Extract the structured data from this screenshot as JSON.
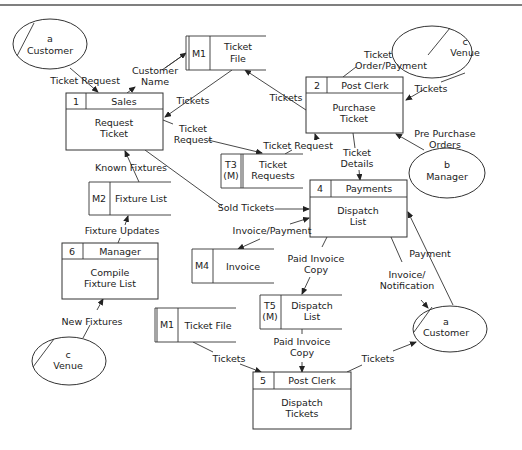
{
  "diagram": {
    "type": "data-flow-diagram",
    "external_entities": [
      {
        "id": "a",
        "name": "Customer",
        "position": "top-left"
      },
      {
        "id": "c",
        "name": "Venue",
        "position": "top-right"
      },
      {
        "id": "b",
        "name": "Manager",
        "position": "right"
      },
      {
        "id": "a",
        "name": "Customer",
        "position": "bottom-right"
      },
      {
        "id": "c",
        "name": "Venue",
        "position": "bottom-left"
      }
    ],
    "processes": [
      {
        "number": "1",
        "actor": "Sales",
        "name_line1": "Request",
        "name_line2": "Ticket"
      },
      {
        "number": "2",
        "actor": "Post Clerk",
        "name_line1": "Purchase",
        "name_line2": "Ticket"
      },
      {
        "number": "4",
        "actor": "Payments",
        "name_line1": "Dispatch",
        "name_line2": "List"
      },
      {
        "number": "6",
        "actor": "Manager",
        "name_line1": "Compile",
        "name_line2": "Fixture List"
      },
      {
        "number": "5",
        "actor": "Post Clerk",
        "name_line1": "Dispatch",
        "name_line2": "Tickets"
      }
    ],
    "data_stores": [
      {
        "id": "M1",
        "name_line1": "Ticket",
        "name_line2": "File"
      },
      {
        "id_line1": "T3",
        "id_line2": "(M)",
        "name_line1": "Ticket",
        "name_line2": "Requests"
      },
      {
        "id": "M2",
        "name": "Fixture List"
      },
      {
        "id": "M4",
        "name": "Invoice"
      },
      {
        "id_line1": "T5",
        "id_line2": "(M)",
        "name_line1": "Dispatch",
        "name_line2": "List"
      },
      {
        "id": "M1",
        "name": "Ticket File"
      }
    ],
    "flows": {
      "ticket_request_1": "Ticket Request",
      "customer_name_l1": "Customer",
      "customer_name_l2": "Name",
      "tickets_m1_to_p1": "Tickets",
      "tickets_p2_to_m1": "Tickets",
      "ticket_order_l1": "Ticket",
      "ticket_order_l2": "Order/Payment",
      "tickets_venue_to_p2": "Tickets",
      "pre_purchase_l1": "Pre Purchase",
      "pre_purchase_l2": "Orders",
      "ticket_request_p1_l1": "Ticket",
      "ticket_request_p1_l2": "Request",
      "ticket_request_t3_to_p2": "Ticket Request",
      "ticket_details_l1": "Ticket",
      "ticket_details_l2": "Details",
      "known_fixtures": "Known Fixtures",
      "sold_tickets": "Sold Tickets",
      "fixture_updates": "Fixture Updates",
      "invoice_payment": "Invoice/Payment",
      "paid_invoice_copy_1_l1": "Paid Invoice",
      "paid_invoice_copy_1_l2": "Copy",
      "invoice_notification_l1": "Invoice/",
      "invoice_notification_l2": "Notification",
      "payment": "Payment",
      "new_fixtures": "New Fixtures",
      "paid_invoice_copy_2_l1": "Paid Invoice",
      "paid_invoice_copy_2_l2": "Copy",
      "tickets_m1b_to_p5": "Tickets",
      "tickets_p5_to_customer": "Tickets"
    }
  }
}
